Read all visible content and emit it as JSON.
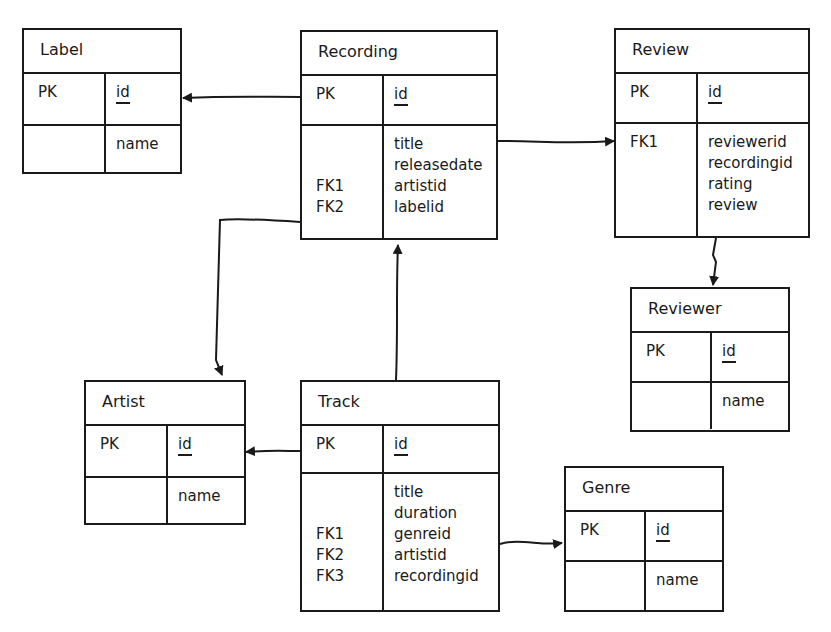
{
  "entities": {
    "label": {
      "name": "Label",
      "pk_key": "PK",
      "pk_field": "id",
      "attr_keys": [
        ""
      ],
      "attr_fields": [
        "name"
      ]
    },
    "recording": {
      "name": "Recording",
      "pk_key": "PK",
      "pk_field": "id",
      "attr_keys": [
        "",
        "",
        "FK1",
        "FK2"
      ],
      "attr_fields": [
        "title",
        "releasedate",
        "artistid",
        "labelid"
      ]
    },
    "review": {
      "name": "Review",
      "pk_key": "PK",
      "pk_field": "id",
      "attr_keys": [
        "FK1",
        "",
        "",
        ""
      ],
      "attr_fields": [
        "reviewerid",
        "recordingid",
        "rating",
        "review"
      ]
    },
    "reviewer": {
      "name": "Reviewer",
      "pk_key": "PK",
      "pk_field": "id",
      "attr_keys": [
        ""
      ],
      "attr_fields": [
        "name"
      ]
    },
    "artist": {
      "name": "Artist",
      "pk_key": "PK",
      "pk_field": "id",
      "attr_keys": [
        ""
      ],
      "attr_fields": [
        "name"
      ]
    },
    "track": {
      "name": "Track",
      "pk_key": "PK",
      "pk_field": "id",
      "attr_keys": [
        "",
        "",
        "FK1",
        "FK2",
        "FK3"
      ],
      "attr_fields": [
        "title",
        "duration",
        "genreid",
        "artistid",
        "recordingid"
      ]
    },
    "genre": {
      "name": "Genre",
      "pk_key": "PK",
      "pk_field": "id",
      "attr_keys": [
        ""
      ],
      "attr_fields": [
        "name"
      ]
    }
  },
  "relationships": [
    {
      "from": "Recording",
      "to": "Label",
      "via": "labelid"
    },
    {
      "from": "Recording",
      "to": "Review",
      "via": "recordingid"
    },
    {
      "from": "Recording",
      "to": "Artist",
      "via": "artistid"
    },
    {
      "from": "Track",
      "to": "Recording",
      "via": "recordingid"
    },
    {
      "from": "Track",
      "to": "Artist",
      "via": "artistid"
    },
    {
      "from": "Track",
      "to": "Genre",
      "via": "genreid"
    },
    {
      "from": "Review",
      "to": "Reviewer",
      "via": "reviewerid"
    }
  ]
}
